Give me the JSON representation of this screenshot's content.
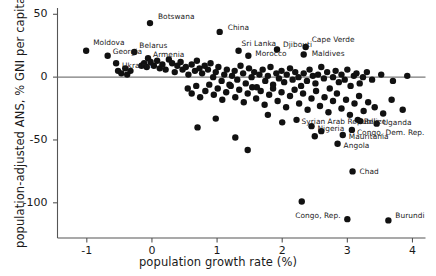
{
  "chart_data": {
    "type": "scatter",
    "title": "",
    "xlabel": "population growth rate (%)",
    "ylabel": "population-adjusted ANS, % GNI per capita",
    "xlim": [
      -1.45,
      4.2
    ],
    "ylim": [
      -128,
      55
    ],
    "xticks": [
      -1,
      0,
      1,
      2,
      3,
      4
    ],
    "xticklabels": [
      "-1",
      "0",
      "1",
      "2",
      "3",
      "4"
    ],
    "yticks": [
      50,
      0,
      -50,
      -100
    ],
    "yticklabels": [
      "50",
      "0",
      "-50",
      "-100"
    ],
    "grid": false,
    "legend": null,
    "zero_line": 0,
    "marker": {
      "color": "#111111",
      "size": 4.2,
      "shape": "circle"
    },
    "labeled_points": [
      {
        "name": "Moldova",
        "x": -1.01,
        "y": 21,
        "lx": 7,
        "ly": -8
      },
      {
        "name": "Georgia",
        "x": -0.68,
        "y": 17,
        "lx": 5,
        "ly": -4
      },
      {
        "name": "Ukraine",
        "x": -0.55,
        "y": 11,
        "lx": 6,
        "ly": 3
      },
      {
        "name": "Belarus",
        "x": -0.27,
        "y": 20,
        "lx": 5,
        "ly": -6
      },
      {
        "name": "Armenia",
        "x": -0.06,
        "y": 15,
        "lx": 5,
        "ly": -3
      },
      {
        "name": "Botswana",
        "x": -0.03,
        "y": 43,
        "lx": 8,
        "ly": -6
      },
      {
        "name": "China",
        "x": 1.04,
        "y": 36,
        "lx": 8,
        "ly": -4
      },
      {
        "name": "Sri Lanka",
        "x": 1.33,
        "y": 21,
        "lx": 3,
        "ly": -7
      },
      {
        "name": "Morocco",
        "x": 1.48,
        "y": 17,
        "lx": 7,
        "ly": -2
      },
      {
        "name": "Djibouti",
        "x": 1.92,
        "y": 22,
        "lx": 6,
        "ly": -4
      },
      {
        "name": "Cape Verde",
        "x": 2.36,
        "y": 24,
        "lx": 6,
        "ly": -7
      },
      {
        "name": "Maldives",
        "x": 2.33,
        "y": 18,
        "lx": 8,
        "ly": -1
      },
      {
        "name": "Syrian Arab Republic",
        "x": 2.22,
        "y": -34,
        "lx": 5,
        "ly": 2
      },
      {
        "name": "Nigeria",
        "x": 2.45,
        "y": -39,
        "lx": 6,
        "ly": 3
      },
      {
        "name": "Belize",
        "x": 3.16,
        "y": -34,
        "lx": 6,
        "ly": 2
      },
      {
        "name": "Uganda",
        "x": 3.45,
        "y": -37,
        "lx": 6,
        "ly": -1
      },
      {
        "name": "Congo, Dem. Rep.",
        "x": 3.07,
        "y": -42,
        "lx": 5,
        "ly": 3
      },
      {
        "name": "Mauritania",
        "x": 2.93,
        "y": -46,
        "lx": 6,
        "ly": 2
      },
      {
        "name": "Angola",
        "x": 2.85,
        "y": -53,
        "lx": 6,
        "ly": 2
      },
      {
        "name": "Chad",
        "x": 3.08,
        "y": -75,
        "lx": 7,
        "ly": 1
      },
      {
        "name": "Congo, Rep.",
        "x": 3.0,
        "y": -113,
        "lx": -52,
        "ly": -3
      },
      {
        "name": "Burundi",
        "x": 3.63,
        "y": -114,
        "lx": 7,
        "ly": -4
      }
    ],
    "points": [
      [
        -1.01,
        21
      ],
      [
        -0.68,
        17
      ],
      [
        -0.55,
        11
      ],
      [
        -0.27,
        20
      ],
      [
        -0.06,
        15
      ],
      [
        -0.03,
        43
      ],
      [
        1.04,
        36
      ],
      [
        1.33,
        21
      ],
      [
        1.48,
        17
      ],
      [
        1.92,
        22
      ],
      [
        2.36,
        24
      ],
      [
        2.33,
        18
      ],
      [
        2.22,
        -34
      ],
      [
        2.45,
        -39
      ],
      [
        3.16,
        -34
      ],
      [
        3.45,
        -37
      ],
      [
        3.07,
        -42
      ],
      [
        2.93,
        -46
      ],
      [
        2.85,
        -53
      ],
      [
        3.08,
        -75
      ],
      [
        3.0,
        -113
      ],
      [
        3.63,
        -114
      ],
      [
        -0.52,
        5
      ],
      [
        -0.47,
        3
      ],
      [
        -0.41,
        7
      ],
      [
        -0.38,
        2
      ],
      [
        -0.33,
        5
      ],
      [
        -0.16,
        9
      ],
      [
        -0.12,
        11
      ],
      [
        -0.08,
        8
      ],
      [
        -0.02,
        12
      ],
      [
        0.03,
        9
      ],
      [
        0.08,
        13
      ],
      [
        0.12,
        7
      ],
      [
        0.16,
        10
      ],
      [
        0.21,
        6
      ],
      [
        0.26,
        14
      ],
      [
        0.31,
        11
      ],
      [
        0.35,
        4
      ],
      [
        0.39,
        9
      ],
      [
        0.44,
        12
      ],
      [
        0.47,
        6
      ],
      [
        0.52,
        8
      ],
      [
        0.56,
        2
      ],
      [
        0.61,
        10
      ],
      [
        0.66,
        5
      ],
      [
        0.69,
        13
      ],
      [
        0.73,
        7
      ],
      [
        0.77,
        3
      ],
      [
        0.81,
        9
      ],
      [
        0.86,
        6
      ],
      [
        0.9,
        11
      ],
      [
        0.94,
        0
      ],
      [
        0.98,
        4
      ],
      [
        1.02,
        8
      ],
      [
        1.07,
        -3
      ],
      [
        1.11,
        2
      ],
      [
        1.15,
        6
      ],
      [
        1.19,
        -6
      ],
      [
        1.23,
        1
      ],
      [
        1.27,
        5
      ],
      [
        1.31,
        -2
      ],
      [
        1.36,
        9
      ],
      [
        1.4,
        3
      ],
      [
        1.44,
        -5
      ],
      [
        1.49,
        7
      ],
      [
        1.53,
        0
      ],
      [
        1.57,
        4
      ],
      [
        1.61,
        -8
      ],
      [
        1.65,
        2
      ],
      [
        1.7,
        6
      ],
      [
        1.74,
        -3
      ],
      [
        1.78,
        1
      ],
      [
        1.82,
        8
      ],
      [
        1.86,
        -6
      ],
      [
        1.91,
        3
      ],
      [
        1.95,
        -1
      ],
      [
        1.99,
        5
      ],
      [
        2.03,
        -4
      ],
      [
        2.07,
        2
      ],
      [
        2.12,
        7
      ],
      [
        2.16,
        -2
      ],
      [
        2.2,
        4
      ],
      [
        2.25,
        0
      ],
      [
        2.29,
        -7
      ],
      [
        2.33,
        3
      ],
      [
        2.38,
        -3
      ],
      [
        2.42,
        6
      ],
      [
        2.47,
        1
      ],
      [
        2.51,
        -5
      ],
      [
        2.55,
        2
      ],
      [
        2.6,
        8
      ],
      [
        2.64,
        -1
      ],
      [
        2.69,
        4
      ],
      [
        2.73,
        -9
      ],
      [
        2.78,
        0
      ],
      [
        2.82,
        5
      ],
      [
        2.87,
        -4
      ],
      [
        2.91,
        2
      ],
      [
        2.96,
        -2
      ],
      [
        3.0,
        6
      ],
      [
        3.05,
        -7
      ],
      [
        3.1,
        1
      ],
      [
        3.14,
        3
      ],
      [
        3.19,
        -5
      ],
      [
        3.24,
        0
      ],
      [
        3.3,
        4
      ],
      [
        3.38,
        -2
      ],
      [
        3.52,
        2
      ],
      [
        3.7,
        -3
      ],
      [
        3.92,
        1
      ],
      [
        0.55,
        -9
      ],
      [
        0.61,
        -13
      ],
      [
        0.68,
        -7
      ],
      [
        0.74,
        -16
      ],
      [
        0.82,
        -11
      ],
      [
        0.88,
        -6
      ],
      [
        0.95,
        -14
      ],
      [
        1.01,
        -9
      ],
      [
        1.08,
        -18
      ],
      [
        1.14,
        -12
      ],
      [
        1.21,
        -7
      ],
      [
        1.28,
        -16
      ],
      [
        1.34,
        -10
      ],
      [
        1.41,
        -20
      ],
      [
        1.47,
        -13
      ],
      [
        1.54,
        -8
      ],
      [
        1.6,
        -17
      ],
      [
        1.67,
        -11
      ],
      [
        1.73,
        -22
      ],
      [
        1.8,
        -14
      ],
      [
        1.86,
        -9
      ],
      [
        1.93,
        -19
      ],
      [
        1.99,
        -12
      ],
      [
        2.06,
        -24
      ],
      [
        2.12,
        -15
      ],
      [
        2.19,
        -10
      ],
      [
        2.26,
        -21
      ],
      [
        2.32,
        -13
      ],
      [
        2.39,
        -26
      ],
      [
        2.45,
        -17
      ],
      [
        2.52,
        -11
      ],
      [
        2.58,
        -23
      ],
      [
        2.65,
        -16
      ],
      [
        2.71,
        -28
      ],
      [
        2.78,
        -19
      ],
      [
        2.84,
        -13
      ],
      [
        2.91,
        -25
      ],
      [
        2.98,
        -18
      ],
      [
        3.04,
        -30
      ],
      [
        3.11,
        -21
      ],
      [
        3.18,
        -15
      ],
      [
        3.25,
        -27
      ],
      [
        3.32,
        -20
      ],
      [
        3.42,
        -24
      ],
      [
        3.55,
        -29
      ],
      [
        3.68,
        -18
      ],
      [
        3.85,
        -26
      ],
      [
        1.28,
        -48
      ],
      [
        0.7,
        -40
      ],
      [
        2.3,
        -99
      ],
      [
        1.47,
        -58
      ],
      [
        2.0,
        -36
      ],
      [
        2.6,
        -43
      ],
      [
        0.98,
        -33
      ],
      [
        1.78,
        -30
      ],
      [
        2.5,
        -47
      ],
      [
        3.2,
        -35
      ]
    ]
  },
  "axes": {
    "x_tick_labels": [
      "-1",
      "0",
      "1",
      "2",
      "3",
      "4"
    ],
    "y_tick_labels": [
      "50",
      "0",
      "-50",
      "-100"
    ],
    "x_title": "population growth rate (%)",
    "y_title": "population-adjusted ANS, % GNI per capita"
  },
  "colors": {
    "marker": "#111111",
    "axis": "#555555",
    "text": "#1a1a1a",
    "background": "#ffffff"
  }
}
